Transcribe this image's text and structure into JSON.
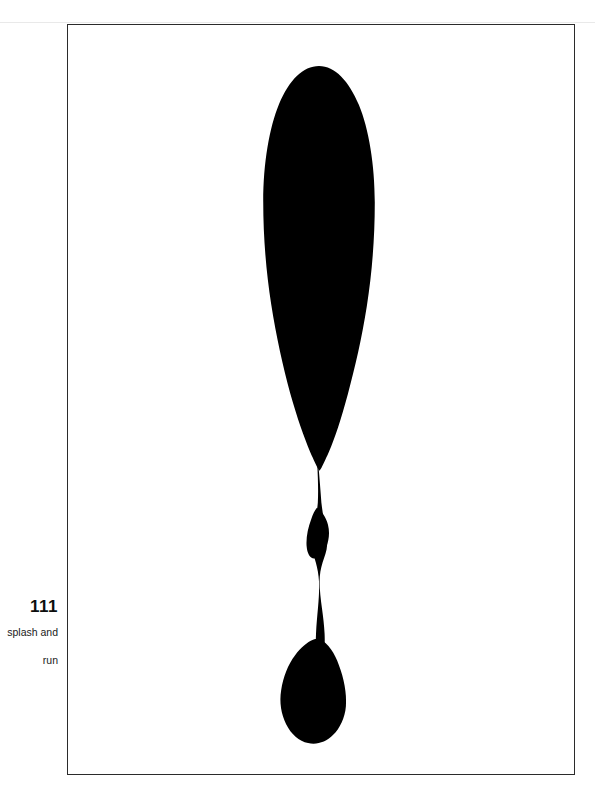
{
  "page": {
    "width": 595,
    "height": 796,
    "background_color": "#ffffff",
    "kind": "scanned-book-plate"
  },
  "plate": {
    "frame": {
      "border_color": "#2b2b2b",
      "fill_color": "#ffffff",
      "left": 67,
      "top": 24,
      "width": 508,
      "height": 751
    },
    "figure": {
      "name": "ink-splash-silhouette",
      "description": "large solid black elongated teardrop with thin trailing stem and a small lower droplet",
      "ink_color": "#000000",
      "bulb": {
        "center_x": 320,
        "top_y": 41,
        "bottom_y": 440,
        "max_width": 104
      },
      "stem": {
        "center_x": 322,
        "top_y": 440,
        "bottom_y": 645,
        "width": 7
      },
      "droplet": {
        "center_x": 324,
        "top_y": 645,
        "bottom_y": 722,
        "max_width": 52
      }
    }
  },
  "caption": {
    "number": "111",
    "lines": [
      "splash and",
      "run"
    ],
    "text_color": "#121212"
  }
}
